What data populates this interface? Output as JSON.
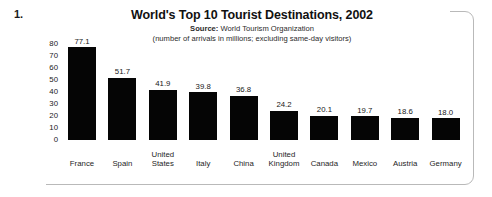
{
  "question_number": "1.",
  "chart_data": {
    "type": "bar",
    "title": "World's Top 10 Tourist Destinations, 2002",
    "source_label": "Source:",
    "source_value": "World Tourism Organization",
    "note": "(number of arrivals in millions; excluding same-day visitors)",
    "categories": [
      "France",
      "Spain",
      "United States",
      "Italy",
      "China",
      "United Kingdom",
      "Canada",
      "Mexico",
      "Austria",
      "Germany"
    ],
    "category_lines": [
      [
        "France"
      ],
      [
        "Spain"
      ],
      [
        "United",
        "States"
      ],
      [
        "Italy"
      ],
      [
        "China"
      ],
      [
        "United",
        "Kingdom"
      ],
      [
        "Canada"
      ],
      [
        "Mexico"
      ],
      [
        "Austria"
      ],
      [
        "Germany"
      ]
    ],
    "values": [
      77.1,
      51.7,
      41.9,
      39.8,
      36.8,
      24.2,
      20.1,
      19.7,
      18.6,
      18.0
    ],
    "value_labels": [
      "77.1",
      "51.7",
      "41.9",
      "39.8",
      "36.8",
      "24.2",
      "20.1",
      "19.7",
      "18.6",
      "18.0"
    ],
    "xlabel": "",
    "ylabel": "",
    "ylim": [
      0,
      80
    ],
    "yticks": [
      80,
      70,
      60,
      50,
      40,
      30,
      20,
      10,
      0
    ],
    "ytick_labels": [
      "80",
      "70",
      "60",
      "50",
      "40",
      "30",
      "20",
      "10",
      "0"
    ],
    "grid": false,
    "legend": false,
    "bar_color": "#050505"
  }
}
